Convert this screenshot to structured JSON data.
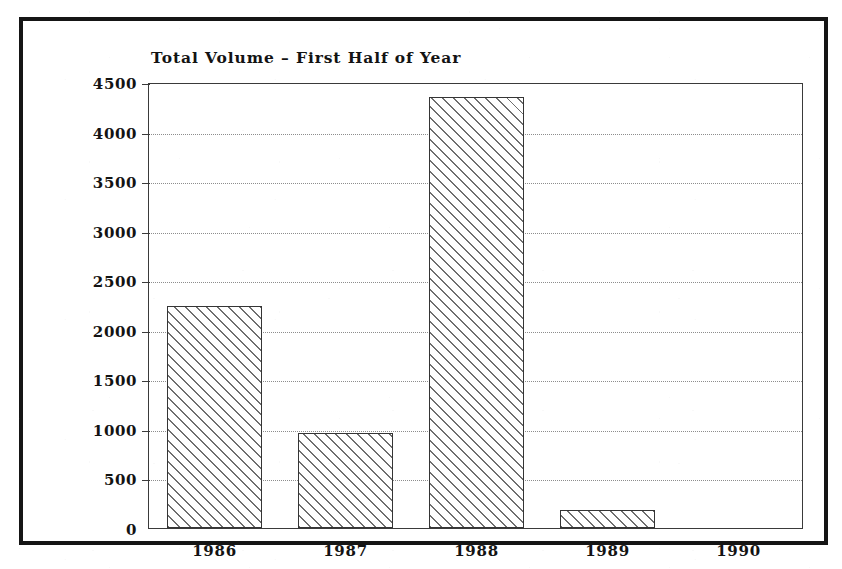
{
  "chart_data": {
    "type": "bar",
    "title": "Total Volume – First Half of Year",
    "xlabel": "",
    "ylabel": "",
    "categories": [
      "1986",
      "1987",
      "1988",
      "1989",
      "1990"
    ],
    "values": [
      2240,
      960,
      4350,
      180,
      0
    ],
    "ylim": [
      0,
      4500
    ],
    "yticks": [
      0,
      500,
      1000,
      1500,
      2000,
      2500,
      3000,
      3500,
      4000,
      4500
    ],
    "ytick_labels": [
      "0",
      "500",
      "1000",
      "1500",
      "2000",
      "2500",
      "3000",
      "3500",
      "4000",
      "4500"
    ],
    "grid": true,
    "grid_style": "dotted-horizontal",
    "legend": null,
    "bar_fill": "diagonal-hatch",
    "colors": {
      "frame": "#151515",
      "axis": "#3a3a3a",
      "grid": "#8d8d8d",
      "bar_edge": "#353535",
      "bar_hatch": "#6f6f6f",
      "text": "#131313",
      "background": "#ffffff"
    }
  }
}
